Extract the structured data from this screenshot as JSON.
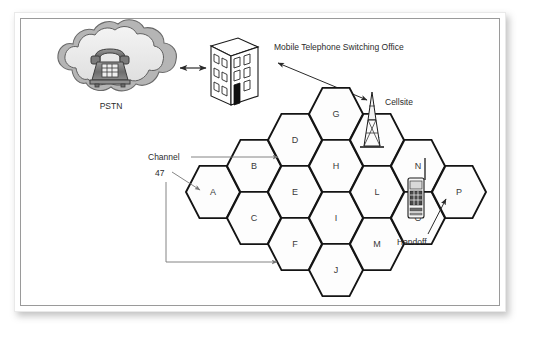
{
  "figure": {
    "type": "cellular-network-diagram",
    "background_color": "#ffffff",
    "plate_color": "#ffffff",
    "border_color": "#9a9a9a"
  },
  "nodes": {
    "pstn": {
      "label": "PSTN",
      "icon": "cloud-with-telephone-icon",
      "cx": 110,
      "cy": 76
    },
    "mtso": {
      "label": "Mobile Telephone Switching Office",
      "icon": "office-building-icon",
      "cx": 231,
      "cy": 77
    },
    "cellsite": {
      "label": "Cellsite",
      "icon": "radio-tower-icon",
      "cx": 372,
      "cy": 120
    },
    "handset": {
      "label": "Handoff",
      "icon": "mobile-handset-icon",
      "cx": 414,
      "cy": 200
    }
  },
  "annotations": {
    "channel_label": "Channel",
    "channel_number": "47",
    "handoff_label": "Handoff",
    "cellsite_label": "Cellsite",
    "pstn_label": "PSTN",
    "mtso_label": "Mobile Telephone Switching Office"
  },
  "cells": [
    {
      "id": "A",
      "label": "A",
      "cx": 213,
      "cy": 192
    },
    {
      "id": "B",
      "label": "B",
      "cx": 254,
      "cy": 166
    },
    {
      "id": "C",
      "label": "C",
      "cx": 254,
      "cy": 218
    },
    {
      "id": "D",
      "label": "D",
      "cx": 295,
      "cy": 140
    },
    {
      "id": "E",
      "label": "E",
      "cx": 295,
      "cy": 192
    },
    {
      "id": "F",
      "label": "F",
      "cx": 295,
      "cy": 244
    },
    {
      "id": "G",
      "label": "G",
      "cx": 336,
      "cy": 114
    },
    {
      "id": "H",
      "label": "H",
      "cx": 336,
      "cy": 166
    },
    {
      "id": "I",
      "label": "I",
      "cx": 336,
      "cy": 218
    },
    {
      "id": "J",
      "label": "J",
      "cx": 336,
      "cy": 270
    },
    {
      "id": "K",
      "label": "K",
      "cx": 377,
      "cy": 140
    },
    {
      "id": "L",
      "label": "L",
      "cx": 377,
      "cy": 192
    },
    {
      "id": "M",
      "label": "M",
      "cx": 377,
      "cy": 244
    },
    {
      "id": "N",
      "label": "N",
      "cx": 418,
      "cy": 166
    },
    {
      "id": "O",
      "label": "O",
      "cx": 418,
      "cy": 218
    },
    {
      "id": "P",
      "label": "P",
      "cx": 459,
      "cy": 192
    }
  ],
  "connections": [
    {
      "from": "pstn",
      "to": "mtso",
      "style": "double-arrow"
    },
    {
      "from": "mtso",
      "to": "cellsite",
      "style": "double-arrow"
    },
    {
      "from": "channel_label",
      "to": "D",
      "style": "single-arrow"
    },
    {
      "from": "channel_number",
      "to": "A",
      "style": "single-arrow"
    },
    {
      "from": "channel_number",
      "to": "F",
      "style": "single-arrow"
    },
    {
      "from": "handoff_label",
      "to": "P",
      "style": "single-arrow"
    }
  ],
  "colors": {
    "hex_stroke": "#141414",
    "hex_fill": "#fdfdfd",
    "leader": "#6e6e6e",
    "text": "#2b2b2b",
    "cell_text": "#3a3a3a"
  }
}
